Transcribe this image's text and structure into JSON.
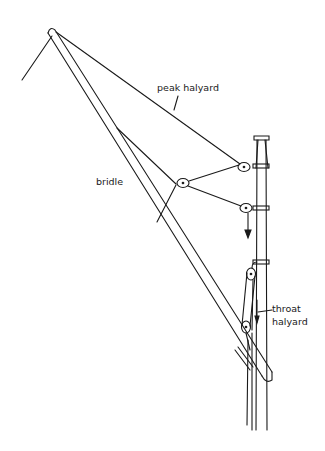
{
  "diagram": {
    "type": "gaff rig halyard arrangement",
    "labels": {
      "peak_halyard": "peak halyard",
      "bridle": "bridle",
      "throat_line1": "throat",
      "throat_line2": "halyard"
    },
    "colors": {
      "ink": "#1a1a1a",
      "background": "#ffffff"
    },
    "components": [
      "gaff",
      "mast",
      "peak halyard",
      "bridle",
      "throat halyard",
      "blocks",
      "arrows"
    ]
  }
}
